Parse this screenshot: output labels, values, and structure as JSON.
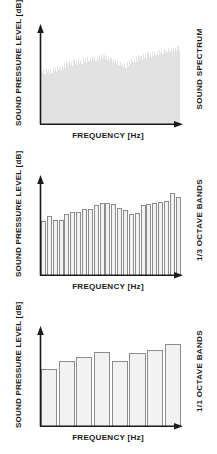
{
  "figure": {
    "axis_titles": {
      "y": "SOUND PRESSURE LEVEL [dB]",
      "x": "FREQUENCY [Hz]"
    }
  },
  "panels": [
    {
      "caption": "SOUND SPECTRUM"
    },
    {
      "caption": "1/3 OCTAVE BANDS"
    },
    {
      "caption": "1/1 OCTAVE BANDS"
    }
  ],
  "colors": {
    "axis": "#1a1a1a",
    "bar_fill": "#f2f2f2",
    "bar_stroke": "#8c8c8c",
    "spectrum_fill": "#e2e2e2",
    "background": "#ffffff"
  },
  "chart_data": [
    {
      "type": "area",
      "title": "SOUND SPECTRUM",
      "xlabel": "FREQUENCY [Hz]",
      "ylabel": "SOUND PRESSURE LEVEL [dB]",
      "grid": false,
      "legend": "none",
      "xlim": [
        0,
        100
      ],
      "ylim": [
        0,
        100
      ],
      "note": "narrow-band spectrum, dense jagged fill rising left to right",
      "values": [
        54,
        52,
        56,
        51,
        57,
        53,
        55,
        50,
        56,
        52,
        58,
        54,
        57,
        53,
        59,
        55,
        58,
        54,
        60,
        56,
        62,
        58,
        63,
        59,
        64,
        60,
        63,
        59,
        65,
        61,
        64,
        60,
        66,
        62,
        65,
        61,
        67,
        63,
        66,
        62,
        68,
        64,
        67,
        63,
        69,
        65,
        68,
        64,
        70,
        66,
        69,
        65,
        71,
        67,
        70,
        66,
        69,
        65,
        68,
        64,
        67,
        63,
        66,
        62,
        65,
        61,
        64,
        60,
        63,
        59,
        62,
        58,
        61,
        57,
        63,
        59,
        65,
        61,
        67,
        63,
        66,
        62,
        68,
        64,
        70,
        66,
        69,
        65,
        71,
        67,
        70,
        66,
        72,
        68,
        71,
        67,
        73,
        69,
        75,
        70,
        74,
        70,
        76,
        72,
        75,
        71,
        77,
        73,
        76,
        72,
        78,
        74,
        77,
        73,
        79,
        75,
        78,
        74,
        80,
        76
      ]
    },
    {
      "type": "bar",
      "title": "1/3 OCTAVE BANDS",
      "xlabel": "FREQUENCY [Hz]",
      "ylabel": "SOUND PRESSURE LEVEL [dB]",
      "grid": false,
      "legend": "none",
      "ylim": [
        0,
        100
      ],
      "categories": [
        "b1",
        "b2",
        "b3",
        "b4",
        "b5",
        "b6",
        "b7",
        "b8",
        "b9",
        "b10",
        "b11",
        "b12",
        "b13",
        "b14",
        "b15",
        "b16",
        "b17",
        "b18",
        "b19",
        "b20",
        "b21",
        "b22",
        "b23",
        "b24"
      ],
      "values": [
        55,
        60,
        56,
        56,
        62,
        64,
        64,
        67,
        67,
        71,
        73,
        73,
        72,
        68,
        66,
        62,
        63,
        71,
        72,
        73,
        74,
        76,
        84,
        80
      ]
    },
    {
      "type": "bar",
      "title": "1/1 OCTAVE BANDS",
      "xlabel": "FREQUENCY [Hz]",
      "ylabel": "SOUND PRESSURE LEVEL [dB]",
      "grid": false,
      "legend": "none",
      "ylim": [
        0,
        100
      ],
      "categories": [
        "o1",
        "o2",
        "o3",
        "o4",
        "o5",
        "o6",
        "o7",
        "o8"
      ],
      "values": [
        58,
        66,
        70,
        76,
        66,
        74,
        78,
        84
      ]
    }
  ]
}
